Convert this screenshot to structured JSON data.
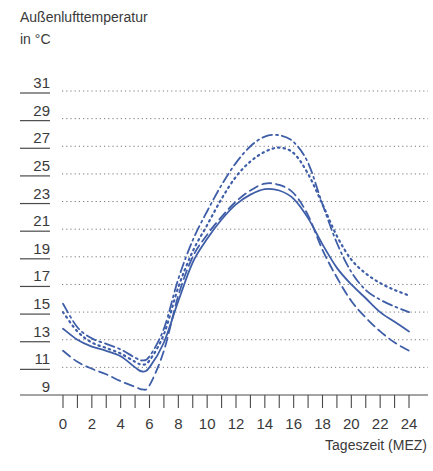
{
  "chart_data": {
    "type": "line",
    "title": "",
    "ylabel_line1": "Außenlufttemperatur",
    "ylabel_line2": "in °C",
    "xlabel": "Tageszeit (MEZ)",
    "xlim": [
      0,
      24
    ],
    "ylim": [
      9,
      31
    ],
    "x_ticks": [
      0,
      2,
      4,
      6,
      8,
      10,
      12,
      14,
      16,
      18,
      20,
      22,
      24
    ],
    "x_minor_ticks": [
      1,
      3,
      5,
      7,
      9,
      11,
      13,
      15,
      17,
      19,
      21,
      23
    ],
    "y_ticks": [
      9,
      11,
      13,
      15,
      17,
      19,
      21,
      23,
      25,
      27,
      29,
      31
    ],
    "grid": "horizontal dotted",
    "legend": "none",
    "line_color": "#3f5ea8",
    "series": [
      {
        "name": "solid",
        "style": "solid",
        "x": [
          0,
          1,
          2,
          3,
          4,
          5,
          5.5,
          6,
          7,
          8,
          9,
          10,
          11,
          12,
          13,
          14,
          15,
          16,
          17,
          18,
          19,
          20,
          21,
          22,
          23,
          24
        ],
        "values": [
          13.8,
          13.0,
          12.5,
          12.2,
          11.8,
          11.0,
          10.7,
          11.0,
          12.8,
          15.8,
          18.6,
          20.3,
          21.7,
          22.8,
          23.5,
          23.9,
          23.8,
          23.2,
          21.8,
          19.9,
          18.2,
          17.0,
          16.0,
          15.0,
          14.3,
          13.6
        ]
      },
      {
        "name": "dashed",
        "style": "dashed",
        "x": [
          0,
          1,
          2,
          3,
          4,
          5,
          5.5,
          6,
          7,
          8,
          9,
          10,
          11,
          12,
          13,
          14,
          15,
          16,
          17,
          18,
          19,
          20,
          21,
          22,
          23,
          24
        ],
        "values": [
          12.2,
          11.4,
          10.9,
          10.5,
          10.0,
          9.6,
          9.4,
          9.7,
          12.2,
          16.2,
          19.0,
          20.6,
          21.9,
          23.0,
          23.8,
          24.3,
          24.2,
          23.6,
          22.0,
          19.5,
          17.5,
          15.8,
          14.6,
          13.6,
          12.8,
          12.2
        ]
      },
      {
        "name": "dotted",
        "style": "dotted",
        "x": [
          0,
          1,
          2,
          3,
          4,
          5,
          5.5,
          6,
          7,
          8,
          9,
          10,
          11,
          12,
          13,
          14,
          15,
          16,
          17,
          18,
          19,
          20,
          21,
          22,
          23,
          24
        ],
        "values": [
          15.0,
          13.6,
          12.8,
          12.4,
          12.0,
          11.4,
          11.2,
          11.5,
          13.4,
          16.8,
          19.4,
          21.3,
          23.2,
          24.8,
          25.9,
          26.6,
          26.9,
          26.5,
          25.0,
          22.8,
          20.5,
          18.8,
          17.8,
          17.1,
          16.6,
          16.2
        ]
      },
      {
        "name": "dash-dot",
        "style": "dashdot",
        "x": [
          0,
          1,
          2,
          3,
          4,
          5,
          5.5,
          6,
          7,
          8,
          9,
          10,
          11,
          12,
          13,
          14,
          15,
          16,
          17,
          18,
          19,
          20,
          21,
          22,
          23,
          24
        ],
        "values": [
          15.6,
          13.9,
          13.1,
          12.7,
          12.3,
          11.7,
          11.5,
          11.8,
          13.8,
          17.4,
          20.2,
          22.3,
          24.2,
          25.8,
          27.0,
          27.7,
          27.8,
          27.3,
          25.8,
          22.8,
          20.0,
          17.9,
          16.6,
          15.9,
          15.4,
          15.0
        ]
      }
    ]
  }
}
